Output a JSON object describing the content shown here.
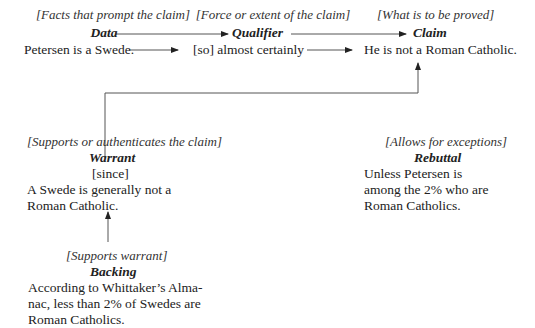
{
  "diagram": {
    "type": "Toulmin argument model",
    "data": {
      "note": "[Facts that prompt the claim]",
      "heading": "Data",
      "text": "Petersen is a Swede."
    },
    "qualifier": {
      "note": "[Force or extent of the claim]",
      "heading": "Qualifier",
      "text": "[so] almost certainly"
    },
    "claim": {
      "note": "[What is to be proved]",
      "heading": "Claim",
      "text": "He is not a Roman Catholic."
    },
    "warrant": {
      "note": "[Supports or authenticates the claim]",
      "heading": "Warrant",
      "connector": "[since]",
      "lines": [
        "A Swede is generally not a",
        "Roman Catholic."
      ]
    },
    "rebuttal": {
      "note": "[Allows for exceptions]",
      "heading": "Rebuttal",
      "lines": [
        "Unless Petersen is",
        "among the 2% who are",
        "Roman Catholics."
      ]
    },
    "backing": {
      "note": "[Supports warrant]",
      "heading": "Backing",
      "lines": [
        "According to Whittaker’s Alma-",
        "nac, less than 2% of Swedes are",
        "Roman Catholics."
      ]
    },
    "edges": [
      {
        "from": "Data",
        "to": "Qualifier"
      },
      {
        "from": "Qualifier",
        "to": "Claim"
      },
      {
        "from": "Warrant",
        "to": "Claim"
      },
      {
        "from": "Backing",
        "to": "Warrant"
      }
    ],
    "colors": {
      "text": "#222222",
      "line": "#555555",
      "background": "#ffffff"
    }
  }
}
